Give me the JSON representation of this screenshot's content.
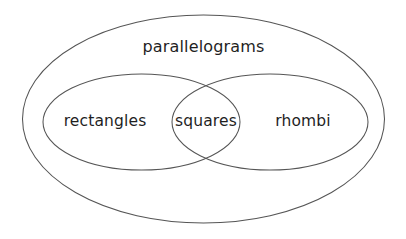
{
  "diagram": {
    "type": "venn",
    "title": "",
    "canvas": {
      "width": 406,
      "height": 239,
      "background": "#ffffff"
    },
    "style": {
      "stroke_color": "#555555",
      "stroke_width": 1.05,
      "text_color": "#1f1f1f",
      "fill": "none"
    },
    "sets": [
      {
        "id": "parallelograms",
        "label": "parallelograms",
        "role": "universe",
        "shape": "ellipse",
        "cx": 203.5,
        "cy": 119,
        "rx": 181,
        "ry": 104,
        "label_x": 203.5,
        "label_y": 52
      },
      {
        "id": "rectangles",
        "label": "rectangles",
        "role": "subset",
        "shape": "ellipse",
        "cx": 141.5,
        "cy": 122,
        "rx": 98.5,
        "ry": 48,
        "label_x": 105,
        "label_y": 126
      },
      {
        "id": "rhombi",
        "label": "rhombi",
        "role": "subset",
        "shape": "ellipse",
        "cx": 270,
        "cy": 122,
        "rx": 98,
        "ry": 48,
        "label_x": 303,
        "label_y": 126
      }
    ],
    "intersections": [
      {
        "id": "squares",
        "label": "squares",
        "of": [
          "rectangles",
          "rhombi"
        ],
        "label_x": 206,
        "label_y": 126
      }
    ]
  }
}
